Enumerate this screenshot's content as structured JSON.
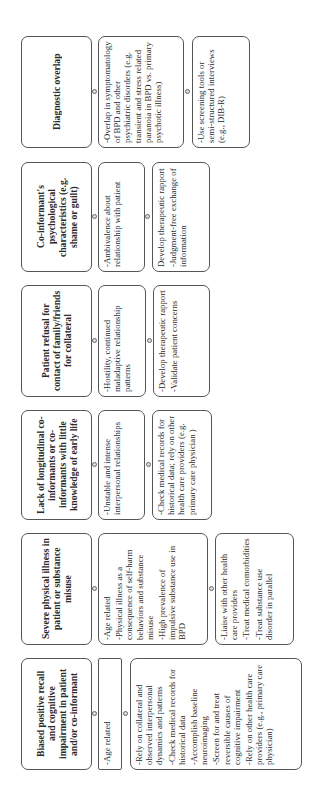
{
  "diagram": {
    "orientation": "rotated-90-ccw",
    "columns": [
      {
        "challenge": "Diagnostic overlap",
        "reason": [
          "-Overlap in symptomatology of BPD and other psychiatric disorders (e.g. transient and stress related paranoia in BPD vs. primary psychotic illness)"
        ],
        "strategies": [
          "-Use screening tools or semi-structured interviews (e.g., DIB-R)"
        ]
      },
      {
        "challenge": "Co-informant's psychological characteristics (e.g. shame or guilt)",
        "reason": [
          "-Ambivalence about relationship with patient"
        ],
        "strategies": [
          "Develop therapeutic rapport",
          "-Judgment-free exchange of information"
        ]
      },
      {
        "challenge": "Patient refusal for contact of family/friends for collateral",
        "reason": [
          "-Hostility, continued maladaptive relationship patterns"
        ],
        "strategies": [
          "-Develop therapeutic rapport",
          "-Validate patient concerns"
        ]
      },
      {
        "challenge": "Lack of longitudinal co-informants or co-informants with little knowledge of early life",
        "reason": [
          "-Unstable and intense interpersonal relationships"
        ],
        "strategies": [
          "-Check medical records for historical data; rely on other health care providers (e.g. primary care physician )"
        ]
      },
      {
        "challenge": "Severe physical illness in patient or substance misuse",
        "reason": [
          "-Age related",
          "-Physical illness as a consequence of self-harm behaviors and substance misuse",
          "-High prevalence of impulsive substance use in BPD"
        ],
        "strategies": [
          "-Liaise with other health care providers",
          "-Treat medical comorbidities",
          "-Treat substance use disorder in parallel"
        ]
      },
      {
        "challenge": "Biased positive recall and cognitive impairment in patient and/or co-informant",
        "reason": [
          "-Age related"
        ],
        "strategies": [
          "-Rely on collateral and observed interpersonal dynamics and patterns",
          "-Check medical records for historical data",
          "-Accomplish baseline neuroimaging",
          "-Screen for and treat reversible causes of cognitive impairment",
          "-Rely on other health care providers (e.g., primary care physician)"
        ]
      }
    ]
  }
}
